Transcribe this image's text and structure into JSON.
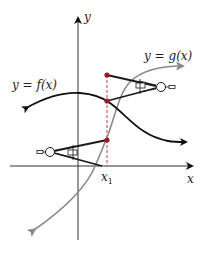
{
  "diagram": {
    "labels": {
      "y_axis": "y",
      "x_axis": "x",
      "f_curve": "y = f(x)",
      "g_curve": "y = g(x)",
      "x1_base": "x",
      "x1_sub": "1"
    },
    "colors": {
      "axes": "#333333",
      "f_curve": "#111111",
      "g_curve": "#8a8a8a",
      "points": "#a0192a",
      "dashed": "#c0404a",
      "compass": "#1a1a1a"
    },
    "points": [
      {
        "name": "g-at-x1-upper",
        "x": 107,
        "y": 75
      },
      {
        "name": "f-at-x1",
        "x": 107,
        "y": 101
      },
      {
        "name": "g-at-x1-lower",
        "x": 107,
        "y": 140
      }
    ]
  }
}
